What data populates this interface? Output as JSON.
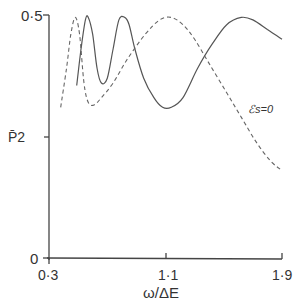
{
  "chart_data": {
    "type": "line",
    "title": "",
    "xlabel": "ω/ΔE",
    "ylabel": "P̄2",
    "xlim": [
      0.3,
      1.9
    ],
    "ylim": [
      0,
      0.5
    ],
    "x_ticks": [
      {
        "value": 0.3,
        "label": "0·3"
      },
      {
        "value": 1.1,
        "label": "1·1"
      },
      {
        "value": 1.9,
        "label": "1·9"
      }
    ],
    "y_ticks": [
      {
        "value": 0,
        "label": "0"
      },
      {
        "value": 0.25,
        "label": ""
      },
      {
        "value": 0.5,
        "label": "0·5"
      }
    ],
    "grid": false,
    "legend": null,
    "annotations": [
      {
        "text": "ℰs=0",
        "attached_to": "dashed",
        "x": 1.78,
        "y": 0.22
      }
    ],
    "series": [
      {
        "name": "solid",
        "style": "solid",
        "x": [
          0.49,
          0.52,
          0.55,
          0.57,
          0.6,
          0.63,
          0.66,
          0.7,
          0.74,
          0.78,
          0.82,
          0.85,
          0.89,
          0.95,
          1.02,
          1.08,
          1.14,
          1.22,
          1.32,
          1.42,
          1.52,
          1.62,
          1.7,
          1.8,
          1.9
        ],
        "y": [
          0.355,
          0.43,
          0.49,
          0.495,
          0.46,
          0.39,
          0.36,
          0.37,
          0.43,
          0.49,
          0.495,
          0.48,
          0.43,
          0.37,
          0.33,
          0.31,
          0.31,
          0.33,
          0.39,
          0.44,
          0.48,
          0.495,
          0.49,
          0.47,
          0.45
        ]
      },
      {
        "name": "ℰs=0",
        "style": "dashed",
        "x": [
          0.38,
          0.42,
          0.45,
          0.48,
          0.51,
          0.54,
          0.57,
          0.61,
          0.66,
          0.74,
          0.84,
          0.96,
          1.06,
          1.14,
          1.22,
          1.3,
          1.4,
          1.52,
          1.62,
          1.72,
          1.82,
          1.9
        ],
        "y": [
          0.31,
          0.39,
          0.46,
          0.495,
          0.46,
          0.36,
          0.32,
          0.315,
          0.33,
          0.36,
          0.41,
          0.46,
          0.49,
          0.495,
          0.48,
          0.45,
          0.4,
          0.34,
          0.29,
          0.24,
          0.2,
          0.18
        ]
      }
    ]
  }
}
